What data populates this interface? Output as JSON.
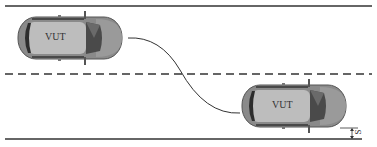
{
  "diagram": {
    "title": "",
    "road": {
      "top_boundary": "solid",
      "center_line": "dashed",
      "bottom_boundary": "solid",
      "line_color": "#333333"
    },
    "vehicles": [
      {
        "id": "start",
        "label": "VUT",
        "lane": "upper",
        "orientation": "right"
      },
      {
        "id": "end",
        "label": "VUT",
        "lane": "lower",
        "orientation": "right"
      }
    ],
    "path": {
      "description": "lane change trajectory from upper lane to lower lane",
      "color": "#333333"
    },
    "dimension": {
      "label": "S",
      "meaning": "lateral offset from bottom road edge to vehicle"
    },
    "colors": {
      "car_body": "#8a8a8a",
      "car_roof": "#b5b5b5",
      "windshield": "#4a4a4a",
      "car_outline": "#555555"
    }
  }
}
